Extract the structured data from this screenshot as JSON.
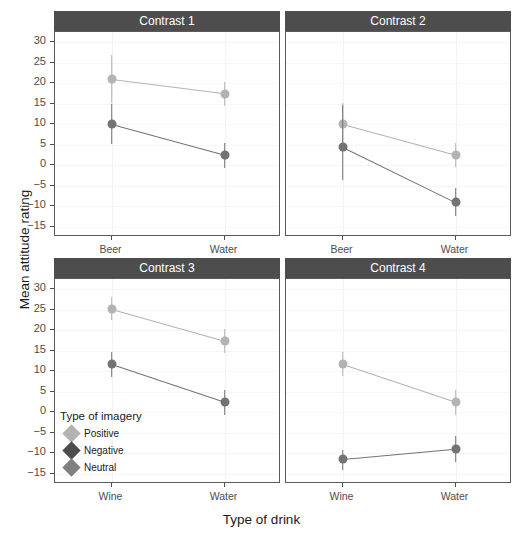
{
  "chart_data": {
    "type": "line",
    "title": "",
    "xlabel": "Type of drink",
    "ylabel": "Mean attitude rating",
    "ylim": [
      -17.5,
      32.5
    ],
    "yticks": [
      -15,
      -10,
      -5,
      0,
      5,
      10,
      15,
      20,
      25,
      30
    ],
    "grid": true,
    "legend": {
      "title": "Type of imagery",
      "position": "inside-panel-3-bottom-left",
      "entries": [
        {
          "name": "Positive",
          "color": "#b3b3b3"
        },
        {
          "name": "Negative",
          "color": "#4d4d4d"
        },
        {
          "name": "Neutral",
          "color": "#808080"
        }
      ]
    },
    "facets": [
      {
        "label": "Contrast 1",
        "categories": [
          "Beer",
          "Water"
        ],
        "series": [
          {
            "name": "Positive",
            "color": "#b3b3b3",
            "values": [
              21.0,
              17.5
            ],
            "err_low": [
              15.3,
              14.4
            ],
            "err_high": [
              27.0,
              20.4
            ]
          },
          {
            "name": "Negative",
            "color": "#737373",
            "values": [
              10.0,
              2.5
            ],
            "err_low": [
              5.3,
              -0.6
            ],
            "err_high": [
              15.0,
              5.4
            ]
          }
        ]
      },
      {
        "label": "Contrast 2",
        "categories": [
          "Beer",
          "Water"
        ],
        "series": [
          {
            "name": "Positive",
            "color": "#b3b3b3",
            "values": [
              10.0,
              2.5
            ],
            "err_low": [
              4.6,
              -0.4
            ],
            "err_high": [
              15.2,
              5.4
            ]
          },
          {
            "name": "Negative",
            "color": "#737373",
            "values": [
              4.5,
              -9.0
            ],
            "err_low": [
              -3.6,
              -12.3
            ],
            "err_high": [
              14.8,
              -5.6
            ]
          }
        ]
      },
      {
        "label": "Contrast 3",
        "categories": [
          "Wine",
          "Water"
        ],
        "series": [
          {
            "name": "Positive",
            "color": "#b3b3b3",
            "values": [
              25.3,
              17.5
            ],
            "err_low": [
              22.6,
              14.4
            ],
            "err_high": [
              28.2,
              20.4
            ]
          },
          {
            "name": "Negative",
            "color": "#737373",
            "values": [
              11.7,
              2.5
            ],
            "err_low": [
              8.7,
              -0.6
            ],
            "err_high": [
              14.6,
              5.4
            ]
          }
        ]
      },
      {
        "label": "Contrast 4",
        "categories": [
          "Wine",
          "Water"
        ],
        "series": [
          {
            "name": "Positive",
            "color": "#b3b3b3",
            "values": [
              11.7,
              2.5
            ],
            "err_low": [
              8.8,
              -0.6
            ],
            "err_high": [
              14.7,
              5.5
            ]
          },
          {
            "name": "Negative",
            "color": "#737373",
            "values": [
              -11.5,
              -9.0
            ],
            "err_low": [
              -14.0,
              -12.2
            ],
            "err_high": [
              -9.1,
              -5.7
            ]
          }
        ]
      }
    ]
  },
  "axis": {
    "y_title": "Mean attitude rating",
    "x_title": "Type of drink",
    "y_tick_labels": [
      "30",
      "25",
      "20",
      "15",
      "10",
      "5",
      "0",
      "−5",
      "−10",
      "−15"
    ]
  },
  "legend": {
    "title": "Type of imagery",
    "items": [
      "Positive",
      "Negative",
      "Neutral"
    ]
  },
  "facet_labels": [
    "Contrast 1",
    "Contrast 2",
    "Contrast 3",
    "Contrast 4"
  ],
  "x_categories": {
    "top": [
      "Beer",
      "Water"
    ],
    "bottom": [
      "Wine",
      "Water"
    ]
  },
  "colors": {
    "positive": "#b3b3b3",
    "negative": "#737373",
    "neutral": "#808080",
    "negative_key": "#4d4d4d",
    "strip_bg": "#4d4d4d",
    "strip_text": "#ffffff",
    "panel_border": "#5a5a5a",
    "grid": "#ececec",
    "background": "#ffffff"
  }
}
